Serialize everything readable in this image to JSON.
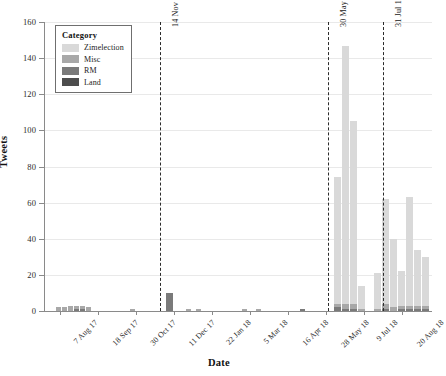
{
  "chart_data": {
    "type": "bar",
    "title": "",
    "xlabel": "Date",
    "ylabel": "Tweets",
    "ylim": [
      0,
      160
    ],
    "yticks": [
      0,
      20,
      40,
      60,
      80,
      100,
      120,
      140,
      160
    ],
    "grid": true,
    "stacked": true,
    "legend_title": "Category",
    "legend_position": "top-left-inside",
    "xlim": [
      "2017-07-31",
      "2018-09-03"
    ],
    "categories": [
      "Zimelection",
      "Misc",
      "RM",
      "Land"
    ],
    "colors": {
      "Zimelection": "#d9d9d9",
      "Misc": "#a8a8a8",
      "RM": "#7a7a7a",
      "Land": "#4d4d4d"
    },
    "xtick_labels": [
      "7 Aug 17",
      "18 Sep 17",
      "30 Oct 17",
      "11 Dec 17",
      "22 Jan 18",
      "5 Mar 18",
      "16 Apr 18",
      "28 May 18",
      "9 Jul 18",
      "20 Aug 18"
    ],
    "xtick_positions_px": [
      60,
      98,
      136,
      174,
      212,
      250,
      288,
      326,
      364,
      402
    ],
    "annotations": [
      {
        "label": "14 Nov 17: Coup",
        "x_px": 160
      },
      {
        "label": "30 May 18: Election announced",
        "x_px": 328
      },
      {
        "label": "31 Jul 18: Election",
        "x_px": 383
      }
    ],
    "bars": [
      {
        "x_px": 56,
        "width": 5,
        "values": {
          "Zimelection": 0,
          "Misc": 2,
          "RM": 0,
          "Land": 0
        }
      },
      {
        "x_px": 62,
        "width": 5,
        "values": {
          "Zimelection": 0,
          "Misc": 2,
          "RM": 0,
          "Land": 0
        }
      },
      {
        "x_px": 68,
        "width": 5,
        "values": {
          "Zimelection": 0,
          "Misc": 3,
          "RM": 0,
          "Land": 0
        }
      },
      {
        "x_px": 74,
        "width": 5,
        "values": {
          "Zimelection": 0,
          "Misc": 2,
          "RM": 1,
          "Land": 0
        }
      },
      {
        "x_px": 80,
        "width": 5,
        "values": {
          "Zimelection": 0,
          "Misc": 2,
          "RM": 1,
          "Land": 0
        }
      },
      {
        "x_px": 86,
        "width": 5,
        "values": {
          "Zimelection": 0,
          "Misc": 2,
          "RM": 0,
          "Land": 0
        }
      },
      {
        "x_px": 130,
        "width": 5,
        "values": {
          "Zimelection": 0,
          "Misc": 1,
          "RM": 0,
          "Land": 0
        }
      },
      {
        "x_px": 166,
        "width": 7,
        "values": {
          "Zimelection": 0,
          "Misc": 0,
          "RM": 10,
          "Land": 0
        }
      },
      {
        "x_px": 186,
        "width": 5,
        "values": {
          "Zimelection": 0,
          "Misc": 1,
          "RM": 0,
          "Land": 0
        }
      },
      {
        "x_px": 196,
        "width": 5,
        "values": {
          "Zimelection": 0,
          "Misc": 1,
          "RM": 0,
          "Land": 0
        }
      },
      {
        "x_px": 242,
        "width": 5,
        "values": {
          "Zimelection": 0,
          "Misc": 1,
          "RM": 0,
          "Land": 0
        }
      },
      {
        "x_px": 256,
        "width": 5,
        "values": {
          "Zimelection": 0,
          "Misc": 1,
          "RM": 0,
          "Land": 0
        }
      },
      {
        "x_px": 300,
        "width": 5,
        "values": {
          "Zimelection": 0,
          "Misc": 0,
          "RM": 1,
          "Land": 0
        }
      },
      {
        "x_px": 334,
        "width": 7,
        "values": {
          "Zimelection": 70,
          "Misc": 2,
          "RM": 2,
          "Land": 0
        }
      },
      {
        "x_px": 342,
        "width": 7,
        "values": {
          "Zimelection": 143,
          "Misc": 3,
          "RM": 1,
          "Land": 0
        }
      },
      {
        "x_px": 350,
        "width": 7,
        "values": {
          "Zimelection": 101,
          "Misc": 3,
          "RM": 1,
          "Land": 0
        }
      },
      {
        "x_px": 358,
        "width": 7,
        "values": {
          "Zimelection": 13,
          "Misc": 1,
          "RM": 0,
          "Land": 0
        }
      },
      {
        "x_px": 374,
        "width": 7,
        "values": {
          "Zimelection": 20,
          "Misc": 1,
          "RM": 0,
          "Land": 0
        }
      },
      {
        "x_px": 382,
        "width": 7,
        "values": {
          "Zimelection": 58,
          "Misc": 3,
          "RM": 1,
          "Land": 0
        }
      },
      {
        "x_px": 390,
        "width": 7,
        "values": {
          "Zimelection": 38,
          "Misc": 2,
          "RM": 0,
          "Land": 0
        }
      },
      {
        "x_px": 398,
        "width": 7,
        "values": {
          "Zimelection": 19,
          "Misc": 2,
          "RM": 1,
          "Land": 0
        }
      },
      {
        "x_px": 406,
        "width": 7,
        "values": {
          "Zimelection": 60,
          "Misc": 2,
          "RM": 1,
          "Land": 0
        }
      },
      {
        "x_px": 414,
        "width": 7,
        "values": {
          "Zimelection": 31,
          "Misc": 2,
          "RM": 1,
          "Land": 0
        }
      },
      {
        "x_px": 422,
        "width": 7,
        "values": {
          "Zimelection": 27,
          "Misc": 2,
          "RM": 1,
          "Land": 0
        }
      }
    ]
  }
}
